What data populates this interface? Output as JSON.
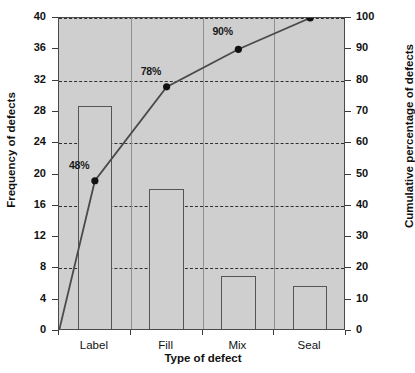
{
  "chart_data": {
    "type": "bar",
    "title": "",
    "subtitle": "",
    "xlabel": "Type of defect",
    "ylabel": "Frequency of defects",
    "y2label": "Cumulative percentage of defects",
    "categories": [
      "Label",
      "Fill",
      "Mix",
      "Seal"
    ],
    "series": [
      {
        "name": "Frequency of defects",
        "type": "bar",
        "axis": "left",
        "values": [
          28.8,
          18.2,
          7.0,
          5.8
        ]
      },
      {
        "name": "Cumulative percentage of defects",
        "type": "line",
        "axis": "right",
        "values": [
          48,
          78,
          90,
          100
        ],
        "point_labels": [
          "48%",
          "78%",
          "90%",
          "100%"
        ],
        "origin_value": 0
      }
    ],
    "ylim": [
      0,
      40
    ],
    "yticks": [
      0,
      4,
      8,
      12,
      16,
      20,
      24,
      28,
      32,
      36,
      40
    ],
    "yticklabels": [
      "0",
      "4",
      "8",
      "12",
      "16",
      "20",
      "24",
      "28",
      "32",
      "36",
      "40"
    ],
    "y2lim": [
      0,
      100
    ],
    "y2ticks": [
      0,
      10,
      20,
      30,
      40,
      50,
      60,
      70,
      80,
      90,
      100
    ],
    "y2ticklabels": [
      "0",
      "10",
      "20",
      "30",
      "40",
      "50",
      "60",
      "70",
      "80",
      "90",
      "100"
    ],
    "gridlines_left": [
      8,
      16,
      24,
      32,
      40
    ],
    "grid": true,
    "grid_style": "dashed",
    "legend": false,
    "legend_position": "none",
    "plot_background": "#cfcfcf",
    "bar_fill": "#cfcfcf",
    "bar_stroke": "#555555",
    "line_color": "#4a4a4a",
    "marker_color": "#111111",
    "frame_color": "#4a4a4a",
    "text_color": "#111111"
  }
}
